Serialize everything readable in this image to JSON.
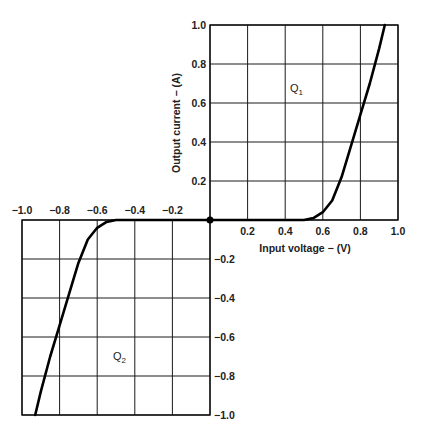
{
  "chart_data": {
    "type": "line",
    "title": "",
    "xlabel": "Input voltage − (V)",
    "ylabel": "Output current − (A)",
    "xlim": [
      -1.0,
      1.0
    ],
    "ylim": [
      -1.0,
      1.0
    ],
    "grid": true,
    "x_ticks_positive": [
      "0.2",
      "0.4",
      "0.6",
      "0.8",
      "1.0"
    ],
    "x_ticks_negative": [
      "−1.0",
      "−0.8",
      "−0.6",
      "−0.4",
      "−0.2"
    ],
    "y_ticks_positive": [
      "1.0",
      "0.8",
      "0.6",
      "0.4",
      "0.2"
    ],
    "y_ticks_negative": [
      "−0.2",
      "−0.4",
      "−0.6",
      "−0.8",
      "−1.0"
    ],
    "annotations": [
      {
        "text": "Q",
        "sub": "1",
        "x": 0.4,
        "y": 0.7
      },
      {
        "text": "Q",
        "sub": "2",
        "x": -0.5,
        "y": -0.65
      }
    ],
    "series": [
      {
        "name": "Q1",
        "x": [
          0.0,
          0.5,
          0.55,
          0.6,
          0.65,
          0.7,
          0.75,
          0.8,
          0.85,
          0.9,
          0.93
        ],
        "y": [
          0.0,
          0.0,
          0.01,
          0.04,
          0.1,
          0.22,
          0.38,
          0.54,
          0.7,
          0.88,
          1.0
        ]
      },
      {
        "name": "Q2",
        "x": [
          0.0,
          -0.5,
          -0.55,
          -0.6,
          -0.65,
          -0.7,
          -0.75,
          -0.8,
          -0.85,
          -0.9,
          -0.93
        ],
        "y": [
          0.0,
          0.0,
          -0.01,
          -0.04,
          -0.1,
          -0.22,
          -0.38,
          -0.54,
          -0.7,
          -0.88,
          -1.0
        ]
      }
    ]
  }
}
